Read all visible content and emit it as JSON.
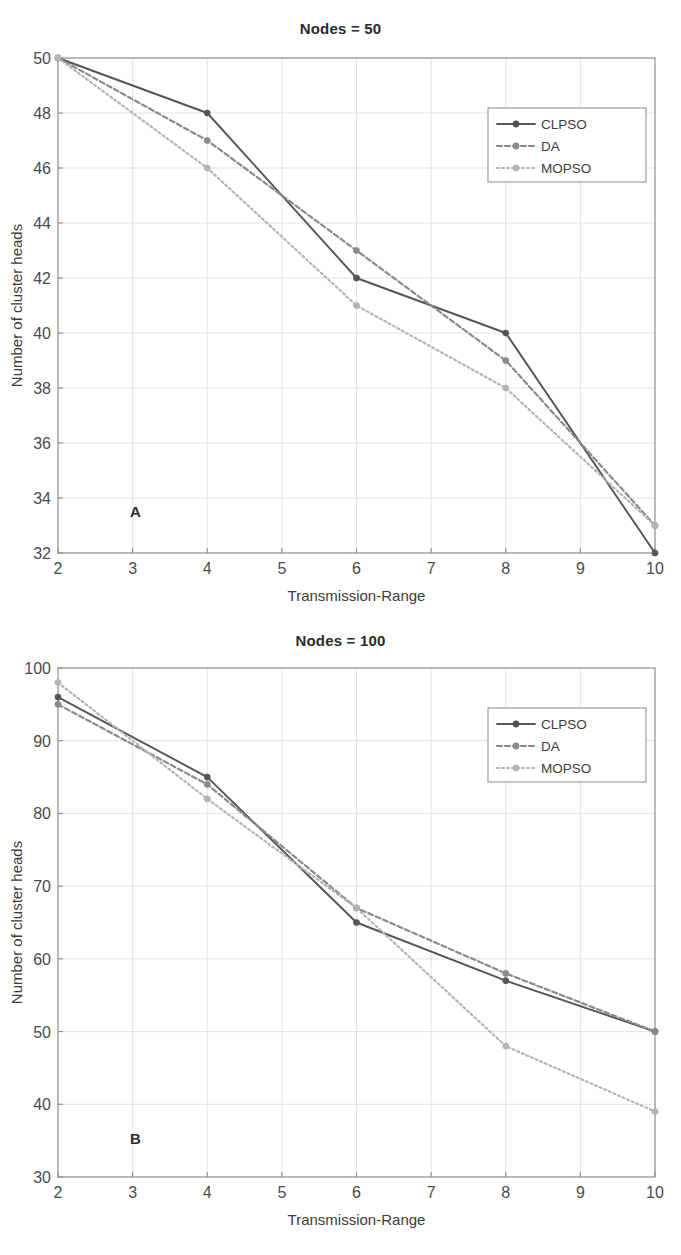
{
  "figure": {
    "panels": [
      {
        "id": "A",
        "letter": "A",
        "title": "Nodes = 50",
        "xlabel": "Transmission-Range",
        "ylabel": "Number of cluster heads",
        "xticks": [
          "2",
          "3",
          "4",
          "5",
          "6",
          "7",
          "8",
          "9",
          "10"
        ],
        "yticks": [
          "32",
          "34",
          "36",
          "38",
          "40",
          "42",
          "44",
          "46",
          "48",
          "50"
        ],
        "legend": [
          "CLPSO",
          "DA",
          "MOPSO"
        ]
      },
      {
        "id": "B",
        "letter": "B",
        "title": "Nodes = 100",
        "xlabel": "Transmission-Range",
        "ylabel": "Number of cluster heads",
        "xticks": [
          "2",
          "3",
          "4",
          "5",
          "6",
          "7",
          "8",
          "9",
          "10"
        ],
        "yticks": [
          "30",
          "40",
          "50",
          "60",
          "70",
          "80",
          "90",
          "100"
        ],
        "legend": [
          "CLPSO",
          "DA",
          "MOPSO"
        ]
      }
    ]
  },
  "colors": {
    "clpso": "#555555",
    "da": "#8a8a8a",
    "mopso": "#b4b4b4",
    "axis": "#8c8c8c",
    "grid": "#dcdcdc",
    "text": "#3c3c3c"
  },
  "chart_data": [
    {
      "type": "line",
      "panel": "A",
      "title": "Nodes = 50",
      "xlabel": "Transmission-Range",
      "ylabel": "Number of cluster heads",
      "x": [
        2,
        4,
        6,
        8,
        10
      ],
      "xlim": [
        2,
        10
      ],
      "ylim": [
        32,
        50
      ],
      "xticks": [
        2,
        3,
        4,
        5,
        6,
        7,
        8,
        9,
        10
      ],
      "yticks": [
        32,
        34,
        36,
        38,
        40,
        42,
        44,
        46,
        48,
        50
      ],
      "grid": true,
      "legend_position": "upper-right",
      "series": [
        {
          "name": "CLPSO",
          "values": [
            50,
            48,
            42,
            40,
            32
          ],
          "style": "solid",
          "color": "#555555"
        },
        {
          "name": "DA",
          "values": [
            50,
            47,
            43,
            39,
            33
          ],
          "style": "dashed",
          "color": "#8a8a8a"
        },
        {
          "name": "MOPSO",
          "values": [
            50,
            46,
            41,
            38,
            33
          ],
          "style": "dotted",
          "color": "#b4b4b4"
        }
      ],
      "annotations": [
        "A"
      ]
    },
    {
      "type": "line",
      "panel": "B",
      "title": "Nodes = 100",
      "xlabel": "Transmission-Range",
      "ylabel": "Number of cluster heads",
      "x": [
        2,
        4,
        6,
        8,
        10
      ],
      "xlim": [
        2,
        10
      ],
      "ylim": [
        30,
        100
      ],
      "xticks": [
        2,
        3,
        4,
        5,
        6,
        7,
        8,
        9,
        10
      ],
      "yticks": [
        30,
        40,
        50,
        60,
        70,
        80,
        90,
        100
      ],
      "grid": true,
      "legend_position": "upper-right",
      "series": [
        {
          "name": "CLPSO",
          "values": [
            96,
            85,
            65,
            57,
            50
          ],
          "style": "solid",
          "color": "#555555"
        },
        {
          "name": "DA",
          "values": [
            95,
            84,
            67,
            58,
            50
          ],
          "style": "dashed",
          "color": "#8a8a8a"
        },
        {
          "name": "MOPSO",
          "values": [
            98,
            82,
            67,
            48,
            39
          ],
          "style": "dotted",
          "color": "#b4b4b4"
        }
      ],
      "annotations": [
        "B"
      ]
    }
  ]
}
